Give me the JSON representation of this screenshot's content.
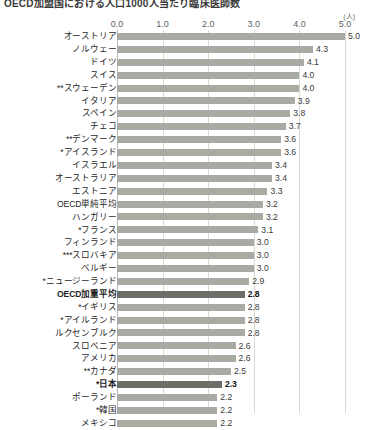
{
  "title": "OECD加盟国における人口1000人当たり臨床医師数",
  "axis": {
    "unit": "(人)",
    "ticks": [
      "0.0",
      "1.0",
      "2.0",
      "3.0",
      "4.0",
      "5.0"
    ]
  },
  "colors": {
    "bar": "#aaaaa4",
    "bar_highlight": "#6e6e68",
    "gridline": "#d8d8d4",
    "text": "#1f1f1f"
  },
  "chart_data": {
    "type": "bar",
    "orientation": "horizontal",
    "title": "OECD加盟国における人口1000人当たり臨床医師数",
    "xlabel": "(人)",
    "ylabel": "",
    "xlim": [
      0,
      5
    ],
    "grid": true,
    "legend": "none",
    "categories": [
      "オーストリア",
      "ノルウェー",
      "ドイツ",
      "スイス",
      "**スウェーデン",
      "イタリア",
      "スペイン",
      "チェコ",
      "**デンマーク",
      "*アイスランド",
      "イスラエル",
      "オーストラリア",
      "エストニア",
      "OECD単純平均",
      "ハンガリー",
      "*フランス",
      "フィンランド",
      "***スロバキア",
      "ベルギー",
      "*ニュージーランド",
      "OECD加重平均",
      "*イギリス",
      "*アイルランド",
      "ルクセンブルク",
      "スロベニア",
      "アメリカ",
      "**カナダ",
      "*日本",
      "ポーランド",
      "*韓国",
      "メキシコ"
    ],
    "values": [
      5.0,
      4.3,
      4.1,
      4.0,
      4.0,
      3.9,
      3.8,
      3.7,
      3.6,
      3.6,
      3.4,
      3.4,
      3.3,
      3.2,
      3.2,
      3.1,
      3.0,
      3.0,
      3.0,
      2.9,
      2.8,
      2.8,
      2.8,
      2.8,
      2.6,
      2.6,
      2.5,
      2.3,
      2.2,
      2.2,
      2.2
    ],
    "highlighted": [
      "OECD加重平均",
      "*日本"
    ]
  }
}
